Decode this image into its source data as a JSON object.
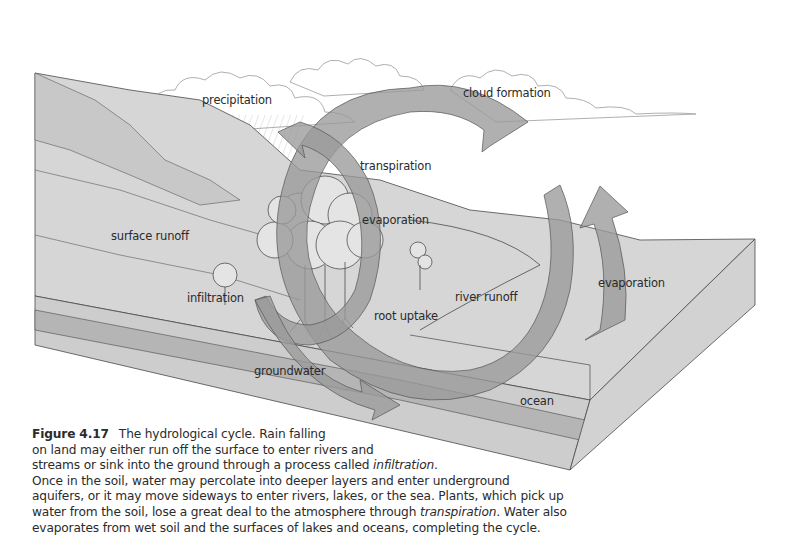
{
  "figure": {
    "number": "Figure 4.17",
    "title": "The hydrological cycle.",
    "labels": {
      "precipitation": "precipitation",
      "cloud_formation": "cloud formation",
      "transpiration": "transpiration",
      "evaporation_land": "evaporation",
      "surface_runoff": "surface runoff",
      "infiltration": "infiltration",
      "river_runoff": "river runoff",
      "root_uptake": "root uptake",
      "evaporation_ocean": "evaporation",
      "groundwater": "groundwater",
      "ocean": "ocean"
    },
    "colors": {
      "land_block": "#d6d6d6",
      "land_block_side": "#cfcfcf",
      "hill_dark": "#c4c4c4",
      "groundwater_band": "#b5b5b5",
      "arrow_fill": "#9a9a9a",
      "arrow_opacity": "0.75",
      "line": "#4a4a4a",
      "sky": "#ffffff"
    }
  },
  "caption": {
    "lines": [
      {
        "pre": "",
        "emph": "",
        "post": "The hydrological cycle. Rain falling"
      },
      {
        "pre": "on land may either run off the surface to enter rivers and",
        "emph": "",
        "post": ""
      },
      {
        "pre": "streams or sink into the ground through a process called ",
        "emph": "infiltration",
        "post": "."
      },
      {
        "pre": "Once in the soil, water may percolate into deeper layers and enter underground",
        "emph": "",
        "post": ""
      },
      {
        "pre": "aquifers, or it may move sideways to enter rivers, lakes, or the sea. Plants, which pick up",
        "emph": "",
        "post": ""
      },
      {
        "pre": "water from the soil, lose a great deal to the atmosphere through ",
        "emph": "transpiration",
        "post": ". Water also"
      },
      {
        "pre": "evaporates from wet soil and the surfaces of lakes and oceans, completing the cycle.",
        "emph": "",
        "post": ""
      }
    ]
  }
}
